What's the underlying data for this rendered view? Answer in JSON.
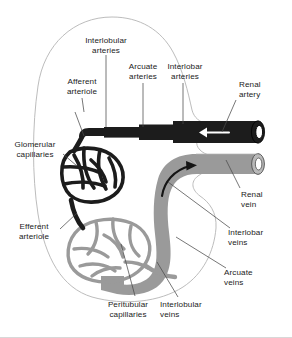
{
  "figure": {
    "colors": {
      "artery": "#1c1c1c",
      "vein": "#9a9a9a",
      "vein_dark": "#8a8a8a",
      "outline": "#b4b4b4",
      "leader": "#4a4a4a",
      "text": "#1b1b1b",
      "background": "#ffffff"
    }
  },
  "labels": [
    {
      "id": "interlobular-arteries",
      "text": "Interlobular\narteries",
      "align": "center"
    },
    {
      "id": "arcuate-arteries",
      "text": "Arcuate\narteries",
      "align": "center"
    },
    {
      "id": "interlobar-arteries",
      "text": "Interlobar\narteries",
      "align": "center"
    },
    {
      "id": "renal-artery",
      "text": "Renal\nartery",
      "align": "left"
    },
    {
      "id": "afferent-arteriole",
      "text": "Afferent\narteriole",
      "align": "center"
    },
    {
      "id": "glomerular-capillaries",
      "text": "Glomerular\ncapillaries",
      "align": "center"
    },
    {
      "id": "efferent-arteriole",
      "text": "Efferent\narteriole",
      "align": "center"
    },
    {
      "id": "renal-vein",
      "text": "Renal\nvein",
      "align": "left"
    },
    {
      "id": "interlobar-veins",
      "text": "Interlobar\nveins",
      "align": "left"
    },
    {
      "id": "arcuate-veins",
      "text": "Arcuate\nveins",
      "align": "left"
    },
    {
      "id": "interlobular-veins",
      "text": "Interlobular\nveins",
      "align": "left"
    },
    {
      "id": "peritubular-capillaries",
      "text": "Peritubular\ncapillaries",
      "align": "center"
    }
  ],
  "structures": [
    {
      "id": "kidney-outline",
      "name": "kidney outline with hilum notch"
    },
    {
      "id": "renal-artery-vessel",
      "name": "renal artery trunk, cut end, dark"
    },
    {
      "id": "renal-vein-vessel",
      "name": "renal vein trunk, cut end, grey"
    },
    {
      "id": "glomerulus-network",
      "name": "glomerular capillary tuft"
    },
    {
      "id": "peritubular-network",
      "name": "peritubular capillary network"
    },
    {
      "id": "artery-flow-arrow",
      "name": "arterial inflow arrow pointing left"
    },
    {
      "id": "vein-flow-arrow",
      "name": "venous outflow arrow pointing right"
    }
  ]
}
